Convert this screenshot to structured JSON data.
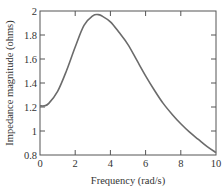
{
  "chart_data": {
    "type": "line",
    "title": "",
    "xlabel": "Frequency (rad/s)",
    "ylabel": "Impedance magnitude (ohms)",
    "xlim": [
      0,
      10
    ],
    "ylim": [
      0.8,
      2
    ],
    "xticks": [
      0,
      2,
      4,
      6,
      8,
      10
    ],
    "xtick_labels": [
      "0",
      "2",
      "4",
      "6",
      "8",
      "10"
    ],
    "yticks": [
      0.8,
      1,
      1.2,
      1.4,
      1.6,
      1.8,
      2
    ],
    "ytick_labels": [
      "0.8",
      "1",
      "1.2",
      "1.4",
      "1.6",
      "1.8",
      "2"
    ],
    "grid": false,
    "legend": null,
    "series": [
      {
        "name": "Impedance magnitude",
        "color": "#6b6b6b",
        "x": [
          0,
          0.25,
          0.5,
          1,
          1.5,
          2,
          2.5,
          3,
          3.3,
          3.5,
          4,
          4.5,
          5,
          5.5,
          6,
          6.5,
          7,
          7.5,
          8,
          8.5,
          9,
          9.5,
          10
        ],
        "y": [
          1.21,
          1.21,
          1.23,
          1.33,
          1.5,
          1.7,
          1.88,
          1.96,
          1.97,
          1.96,
          1.91,
          1.82,
          1.72,
          1.59,
          1.46,
          1.34,
          1.23,
          1.14,
          1.06,
          0.99,
          0.93,
          0.87,
          0.82
        ]
      }
    ]
  },
  "colors": {
    "axis": "#555555",
    "curve": "#6b6b6b",
    "text": "#333333"
  }
}
